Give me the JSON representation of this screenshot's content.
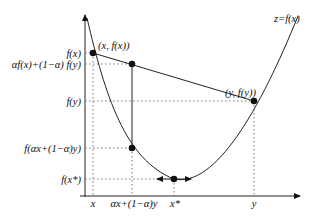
{
  "diagram": {
    "curve_label": "z=f(x)",
    "points": {
      "p_x": {
        "label": "(x, f(x))",
        "px": [
          93,
          53
        ]
      },
      "p_mix_chord": {
        "label": "",
        "px": [
          132,
          64
        ]
      },
      "p_y": {
        "label": "(y, f(y))",
        "px": [
          254,
          101
        ]
      },
      "p_mix_curve": {
        "label": "",
        "px": [
          132,
          148
        ]
      },
      "p_min": {
        "label": "",
        "px": [
          174,
          179
        ]
      }
    },
    "y_axis_labels": {
      "fx": "f(x)",
      "chord": "αf(x)+(1−α) f(y)",
      "fy": "f(y)",
      "fmix": "f(αx+(1−α)y)",
      "fmin": "f(x*)"
    },
    "x_axis_labels": {
      "x": "x",
      "mix": "αx+(1−α)y",
      "xstar": "x*",
      "y": "y"
    },
    "colors": {
      "line": "#222222",
      "dotted": "#555555",
      "point": "#111111"
    }
  }
}
